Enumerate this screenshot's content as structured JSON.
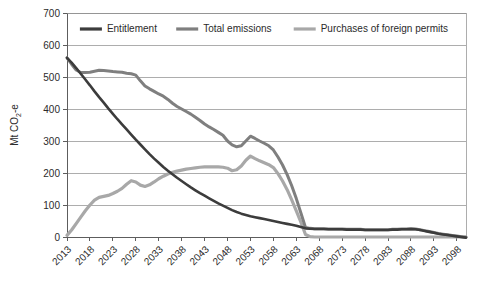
{
  "chart_data": {
    "type": "line",
    "title": "",
    "xlabel": "",
    "ylabel": "Mt CO₂-e",
    "ylabel_parts": {
      "pre": "Mt CO",
      "sub": "2",
      "post": "-e"
    },
    "xlim": [
      2013,
      2100
    ],
    "ylim": [
      0,
      700
    ],
    "ytick_step": 100,
    "yticks": [
      0,
      100,
      200,
      300,
      400,
      500,
      600,
      700
    ],
    "xticks": [
      2013,
      2018,
      2023,
      2028,
      2033,
      2038,
      2043,
      2048,
      2053,
      2058,
      2063,
      2068,
      2073,
      2078,
      2083,
      2088,
      2093,
      2098
    ],
    "grid": "horizontal",
    "legend_position": "top-inside",
    "x": [
      2013,
      2014,
      2015,
      2016,
      2017,
      2018,
      2019,
      2020,
      2021,
      2022,
      2023,
      2024,
      2025,
      2026,
      2027,
      2028,
      2029,
      2030,
      2031,
      2032,
      2033,
      2034,
      2035,
      2036,
      2037,
      2038,
      2039,
      2040,
      2041,
      2042,
      2043,
      2044,
      2045,
      2046,
      2047,
      2048,
      2049,
      2050,
      2051,
      2052,
      2053,
      2054,
      2055,
      2056,
      2057,
      2058,
      2059,
      2060,
      2061,
      2062,
      2063,
      2064,
      2065,
      2066,
      2067,
      2068,
      2069,
      2070,
      2071,
      2072,
      2073,
      2074,
      2075,
      2076,
      2077,
      2078,
      2079,
      2080,
      2081,
      2082,
      2083,
      2084,
      2085,
      2086,
      2087,
      2088,
      2089,
      2090,
      2091,
      2092,
      2093,
      2094,
      2095,
      2096,
      2097,
      2098,
      2099,
      2100
    ],
    "series": [
      {
        "name": "Entitlement",
        "color": "#3c3c3c",
        "width": 2.6,
        "values": [
          560,
          545,
          528,
          510,
          492,
          474,
          455,
          437,
          420,
          402,
          385,
          368,
          352,
          336,
          320,
          304,
          289,
          274,
          259,
          245,
          232,
          219,
          207,
          196,
          185,
          175,
          165,
          155,
          146,
          137,
          129,
          121,
          113,
          105,
          98,
          91,
          84,
          78,
          73,
          69,
          65,
          62,
          59,
          56,
          53,
          50,
          47,
          44,
          41,
          38,
          35,
          31,
          27,
          26,
          25,
          25,
          25,
          24,
          24,
          24,
          24,
          23,
          23,
          23,
          23,
          22,
          22,
          22,
          22,
          22,
          22,
          23,
          23,
          24,
          24,
          25,
          24,
          22,
          19,
          16,
          13,
          10,
          8,
          6,
          4,
          2,
          0,
          -2
        ]
      },
      {
        "name": "Total emissions",
        "color": "#7f7f7f",
        "width": 3.0,
        "values": [
          560,
          540,
          522,
          514,
          514,
          515,
          518,
          521,
          520,
          519,
          517,
          516,
          515,
          512,
          510,
          506,
          488,
          472,
          463,
          455,
          447,
          440,
          430,
          418,
          408,
          400,
          392,
          384,
          374,
          364,
          353,
          344,
          336,
          327,
          318,
          300,
          288,
          282,
          285,
          300,
          315,
          308,
          300,
          293,
          285,
          272,
          250,
          225,
          195,
          160,
          120,
          75,
          30,
          27,
          26,
          26,
          26,
          25,
          25,
          25,
          25,
          24,
          24,
          24,
          24,
          23,
          23,
          23,
          23,
          23,
          23,
          24,
          24,
          25,
          25,
          26,
          25,
          23,
          20,
          17,
          14,
          11,
          9,
          7,
          5,
          3,
          1,
          -1
        ]
      },
      {
        "name": "Purchases of foreign permits",
        "color": "#a8a8a8",
        "width": 3.2,
        "values": [
          5,
          22,
          42,
          62,
          82,
          100,
          115,
          124,
          127,
          130,
          136,
          143,
          152,
          165,
          176,
          172,
          162,
          158,
          163,
          172,
          182,
          190,
          197,
          202,
          206,
          209,
          212,
          214,
          216,
          218,
          219,
          219,
          219,
          219,
          218,
          215,
          207,
          210,
          222,
          240,
          253,
          245,
          238,
          232,
          226,
          217,
          198,
          175,
          148,
          116,
          82,
          46,
          8,
          1,
          0,
          0,
          0,
          0,
          0,
          0,
          0,
          0,
          0,
          0,
          0,
          0,
          0,
          0,
          0,
          0,
          0,
          0,
          0,
          0,
          0,
          0,
          0,
          0,
          0,
          0,
          0,
          0,
          0,
          0,
          0,
          0,
          0,
          0
        ]
      }
    ],
    "legend": [
      {
        "label": "Entitlement",
        "color": "#3c3c3c"
      },
      {
        "label": "Total emissions",
        "color": "#7f7f7f"
      },
      {
        "label": "Purchases of foreign permits",
        "color": "#a8a8a8"
      }
    ]
  }
}
